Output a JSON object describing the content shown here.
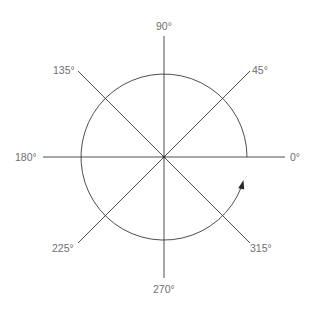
{
  "diagram": {
    "center": {
      "x": 164,
      "y": 157
    },
    "radius": 83,
    "axis_half_length": 121,
    "line_color": "#3a3a3a",
    "label_color": "#6f6f6f",
    "direction": "counter-clockwise",
    "labels": [
      {
        "angle": 0,
        "text": "0°"
      },
      {
        "angle": 45,
        "text": "45°"
      },
      {
        "angle": 90,
        "text": "90°"
      },
      {
        "angle": 135,
        "text": "135°"
      },
      {
        "angle": 180,
        "text": "180°"
      },
      {
        "angle": 225,
        "text": "225°"
      },
      {
        "angle": 270,
        "text": "270°"
      },
      {
        "angle": 315,
        "text": "315°"
      }
    ]
  }
}
